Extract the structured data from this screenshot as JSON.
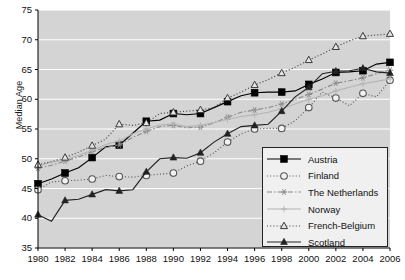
{
  "chart_data": {
    "type": "line",
    "title": "",
    "xlabel": "",
    "ylabel": "Median Age",
    "xlim": [
      1980,
      2006
    ],
    "ylim": [
      35,
      75
    ],
    "yticks": [
      35,
      40,
      45,
      50,
      55,
      60,
      65,
      70,
      75
    ],
    "grid": true,
    "legend_position": "bottom-right",
    "x": [
      1980,
      1981,
      1982,
      1983,
      1984,
      1985,
      1986,
      1987,
      1988,
      1989,
      1990,
      1991,
      1992,
      1993,
      1994,
      1995,
      1996,
      1997,
      1998,
      1999,
      2000,
      2001,
      2002,
      2003,
      2004,
      2005,
      2006
    ],
    "xticks": [
      "1980",
      "1982",
      "1984",
      "1986",
      "1988",
      "1990",
      "1992",
      "1994",
      "1996",
      "1998",
      "2000",
      "2002",
      "2004",
      "2006"
    ],
    "series": [
      {
        "name": "Austria",
        "color": "#000000",
        "marker": "filled-square",
        "dash": "solid",
        "values": [
          45.8,
          46.6,
          47.6,
          48.5,
          50.2,
          52.0,
          52.3,
          54.3,
          56.3,
          56.5,
          57.6,
          57.4,
          57.6,
          58.6,
          59.6,
          60.6,
          61.1,
          61.2,
          61.2,
          61.4,
          62.5,
          63.4,
          64.5,
          64.6,
          64.8,
          65.9,
          66.2
        ]
      },
      {
        "name": "Finland",
        "color": "#555555",
        "marker": "open-circle",
        "dash": "dotted",
        "values": [
          44.8,
          46.1,
          46.3,
          46.4,
          46.6,
          47.2,
          47.0,
          46.9,
          47.2,
          47.4,
          47.6,
          48.8,
          49.6,
          51.0,
          52.8,
          54.2,
          55.0,
          55.1,
          55.1,
          56.4,
          58.6,
          61.2,
          60.2,
          58.9,
          61.0,
          60.4,
          63.2
        ]
      },
      {
        "name": "The Netherlands",
        "color": "#8a8a8a",
        "marker": "asterisk",
        "dash": "dash-dot",
        "values": [
          48.4,
          48.9,
          49.6,
          50.3,
          51.2,
          51.9,
          52.3,
          53.6,
          54.6,
          55.4,
          55.6,
          55.2,
          55.3,
          56.0,
          57.0,
          57.8,
          58.2,
          58.6,
          59.2,
          60.0,
          60.8,
          61.7,
          62.7,
          63.1,
          63.6,
          64.3,
          64.9
        ]
      },
      {
        "name": "Norway",
        "color": "#b4b4b4",
        "marker": "plus",
        "dash": "solid",
        "values": [
          48.8,
          49.4,
          49.8,
          50.6,
          51.4,
          52.4,
          53.0,
          54.2,
          55.0,
          55.7,
          55.8,
          55.4,
          55.6,
          56.1,
          56.6,
          57.1,
          57.4,
          57.8,
          58.4,
          59.2,
          60.0,
          60.6,
          61.4,
          62.0,
          62.6,
          63.0,
          63.4
        ]
      },
      {
        "name": "French-Belgium",
        "color": "#3a3a3a",
        "marker": "open-triangle",
        "dash": "dotted",
        "values": [
          49.0,
          49.5,
          50.2,
          51.1,
          52.2,
          53.3,
          55.8,
          55.6,
          56.0,
          57.6,
          57.8,
          58.0,
          58.2,
          58.6,
          60.2,
          61.2,
          62.4,
          63.3,
          64.4,
          65.4,
          66.6,
          67.6,
          68.8,
          69.8,
          70.6,
          70.8,
          71.0
        ]
      },
      {
        "name": "Scotland",
        "color": "#222222",
        "marker": "filled-triangle",
        "dash": "solid",
        "values": [
          40.6,
          39.5,
          43.0,
          43.2,
          44.0,
          44.8,
          44.6,
          44.8,
          47.8,
          50.0,
          50.2,
          50.1,
          51.0,
          52.8,
          54.2,
          55.4,
          55.6,
          55.8,
          58.0,
          60.4,
          62.0,
          64.3,
          64.7,
          64.8,
          65.2,
          64.6,
          64.4
        ]
      }
    ]
  },
  "axes": {
    "y_label": "Median Age",
    "y_ticks": [
      "75",
      "70",
      "65",
      "60",
      "55",
      "50",
      "45",
      "40",
      "35"
    ],
    "x_ticks": [
      "1980",
      "1982",
      "1984",
      "1986",
      "1988",
      "1990",
      "1992",
      "1994",
      "1996",
      "1998",
      "2000",
      "2002",
      "2004",
      "2006"
    ]
  },
  "legend": {
    "items": [
      {
        "label": "Austria"
      },
      {
        "label": "Finland"
      },
      {
        "label": "The Netherlands"
      },
      {
        "label": "Norway"
      },
      {
        "label": "French-Belgium"
      },
      {
        "label": "Scotland"
      }
    ]
  },
  "style": {
    "plot_background": "#d4d4d4",
    "grid_color": "#ffffff",
    "axis_color": "#000000"
  }
}
